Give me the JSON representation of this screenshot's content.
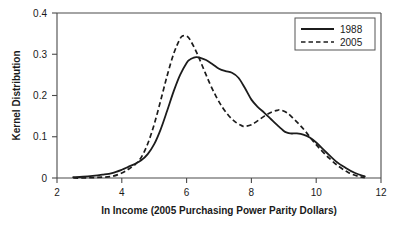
{
  "chart_data": {
    "type": "line",
    "title": "",
    "subtitle": "",
    "xlabel": "In Income (2005 Purchasing Power Parity Dollars)",
    "ylabel": "Kernel Distribution",
    "xlim": [
      2,
      12
    ],
    "ylim": [
      0,
      0.4
    ],
    "xticks": [
      2,
      4,
      6,
      8,
      10,
      12
    ],
    "xtick_labels": [
      "2",
      "4",
      "6",
      "8",
      "10",
      "12"
    ],
    "yticks": [
      0,
      0.1,
      0.2,
      0.3,
      0.4
    ],
    "ytick_labels": [
      "0",
      "0.1",
      "0.2",
      "0.3",
      "0.4"
    ],
    "grid": false,
    "legend_position": "top-right",
    "legend_entries": [
      "1988",
      "2005"
    ],
    "series": [
      {
        "name": "1988",
        "style": "solid",
        "color": "#1c1c1c",
        "x": [
          2.5,
          2.8,
          3.1,
          3.4,
          3.7,
          4.0,
          4.2,
          4.4,
          4.6,
          4.8,
          5.0,
          5.2,
          5.4,
          5.6,
          5.8,
          6.0,
          6.1,
          6.2,
          6.3,
          6.4,
          6.6,
          6.8,
          7.0,
          7.2,
          7.4,
          7.6,
          7.8,
          8.0,
          8.2,
          8.4,
          8.6,
          8.8,
          9.0,
          9.1,
          9.2,
          9.3,
          9.4,
          9.6,
          9.8,
          10.0,
          10.3,
          10.6,
          10.9,
          11.2,
          11.5
        ],
        "y": [
          0.002,
          0.003,
          0.005,
          0.008,
          0.012,
          0.02,
          0.027,
          0.034,
          0.043,
          0.058,
          0.082,
          0.118,
          0.163,
          0.21,
          0.25,
          0.279,
          0.287,
          0.291,
          0.293,
          0.292,
          0.286,
          0.276,
          0.265,
          0.259,
          0.255,
          0.243,
          0.218,
          0.19,
          0.172,
          0.158,
          0.143,
          0.128,
          0.114,
          0.11,
          0.108,
          0.108,
          0.108,
          0.105,
          0.098,
          0.086,
          0.063,
          0.041,
          0.025,
          0.012,
          0.004
        ]
      },
      {
        "name": "2005",
        "style": "dashed",
        "color": "#1c1c1c",
        "x": [
          2.5,
          2.8,
          3.1,
          3.4,
          3.7,
          4.0,
          4.2,
          4.4,
          4.6,
          4.8,
          5.0,
          5.2,
          5.4,
          5.6,
          5.8,
          5.9,
          6.0,
          6.1,
          6.3,
          6.5,
          6.7,
          6.9,
          7.1,
          7.3,
          7.5,
          7.7,
          7.8,
          8.0,
          8.2,
          8.4,
          8.6,
          8.8,
          8.9,
          9.1,
          9.3,
          9.5,
          9.7,
          9.9,
          10.1,
          10.4,
          10.7,
          11.0,
          11.3,
          11.5
        ],
        "y": [
          0.0,
          0.0,
          0.001,
          0.002,
          0.004,
          0.012,
          0.021,
          0.032,
          0.05,
          0.083,
          0.13,
          0.188,
          0.248,
          0.301,
          0.338,
          0.345,
          0.344,
          0.336,
          0.306,
          0.269,
          0.232,
          0.199,
          0.172,
          0.151,
          0.136,
          0.127,
          0.125,
          0.129,
          0.139,
          0.15,
          0.159,
          0.164,
          0.165,
          0.158,
          0.144,
          0.128,
          0.11,
          0.09,
          0.072,
          0.048,
          0.028,
          0.013,
          0.004,
          0.001
        ]
      }
    ]
  },
  "axes": {
    "ylabel": "Kernel Distribution",
    "xlabel": "In Income (2005 Purchasing Power Parity Dollars)",
    "ytick_labels": [
      "0.4",
      "0.3",
      "0.2",
      "0.1",
      "0"
    ],
    "xtick_labels": [
      "2",
      "4",
      "6",
      "8",
      "10",
      "12"
    ]
  },
  "legend": {
    "items": [
      {
        "label": "1988",
        "style": "solid"
      },
      {
        "label": "2005",
        "style": "dashed"
      }
    ]
  },
  "colors": {
    "line": "#1c1c1c",
    "axis": "#4a4a4a",
    "background": "#ffffff"
  }
}
